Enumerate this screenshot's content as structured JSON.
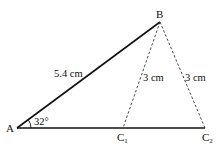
{
  "diagram": {
    "type": "triangle-construction",
    "points": {
      "A": {
        "label": "A"
      },
      "B": {
        "label": "B"
      },
      "C1": {
        "label": "C",
        "subscript": "1"
      },
      "C2": {
        "label": "C",
        "subscript": "2"
      }
    },
    "segments": [
      {
        "from": "A",
        "to": "B",
        "style": "solid",
        "label": "5.4 cm"
      },
      {
        "from": "A",
        "to": "C2",
        "style": "solid",
        "label": ""
      },
      {
        "from": "B",
        "to": "C1",
        "style": "dashed",
        "label": "3 cm"
      },
      {
        "from": "B",
        "to": "C2",
        "style": "dashed",
        "label": "3 cm"
      }
    ],
    "angle": {
      "vertex": "A",
      "label": "32°"
    }
  }
}
